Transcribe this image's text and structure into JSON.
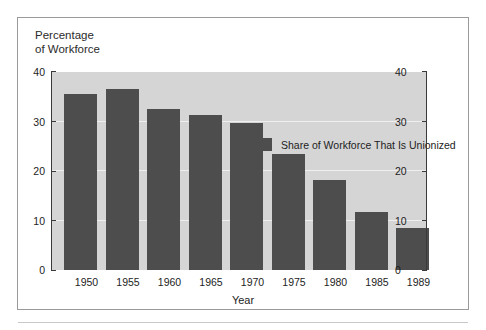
{
  "chart_data": {
    "type": "bar",
    "title": "",
    "ylabel": "Percentage\nof Workforce",
    "xlabel": "Year",
    "categories": [
      "1950",
      "1955",
      "1960",
      "1965",
      "1970",
      "1975",
      "1980",
      "1985",
      "1989"
    ],
    "values": [
      35.5,
      36.5,
      32.5,
      31.3,
      29.8,
      23.5,
      18.2,
      11.7,
      8.5
    ],
    "series": [
      {
        "name": "Share of Workforce That Is Unionized",
        "values": [
          35.5,
          36.5,
          32.5,
          31.3,
          29.8,
          23.5,
          18.2,
          11.7,
          8.5
        ]
      }
    ],
    "ylim": [
      0,
      40
    ],
    "yticks": [
      "0",
      "10",
      "20",
      "30",
      "40"
    ],
    "ytick_values": [
      0,
      10,
      20,
      30,
      40
    ],
    "right_axis": true,
    "right_yticks": [
      "0",
      "10",
      "20",
      "30",
      "40"
    ],
    "grid": true,
    "legend_position": "inside top-right",
    "legend": [
      {
        "label": "Share of Workforce That Is Unionized",
        "color": "#4d4d4d"
      }
    ],
    "colors": {
      "bar": "#4d4d4d",
      "plot_background": "#d5d5d5",
      "gridline": "#efefef",
      "axis": "#3a3a3a",
      "frame": "#9a9a9a",
      "text": "#1d1d1d"
    }
  }
}
